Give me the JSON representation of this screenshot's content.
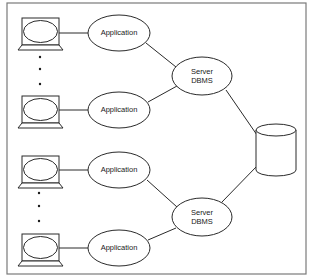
{
  "diagram": {
    "type": "client-server architecture",
    "colors": {
      "stroke": "#2a2a2a",
      "frame": "#7a7a7a",
      "text": "#1a1a1a",
      "background": "#ffffff"
    },
    "groups": [
      {
        "clients": [
          {
            "icon": "computer-icon"
          },
          {
            "icon": "computer-icon"
          }
        ],
        "applications": [
          {
            "label": "Application"
          },
          {
            "label": "Application"
          }
        ],
        "ellipsis_dots": 3,
        "server": {
          "line1": "Server",
          "line2": "DBMS"
        }
      },
      {
        "clients": [
          {
            "icon": "computer-icon"
          },
          {
            "icon": "computer-icon"
          }
        ],
        "applications": [
          {
            "label": "Application"
          },
          {
            "label": "Application"
          }
        ],
        "ellipsis_dots": 3,
        "server": {
          "line1": "Server",
          "line2": "DBMS"
        }
      }
    ],
    "database": {
      "icon": "database-cylinder-icon"
    }
  }
}
